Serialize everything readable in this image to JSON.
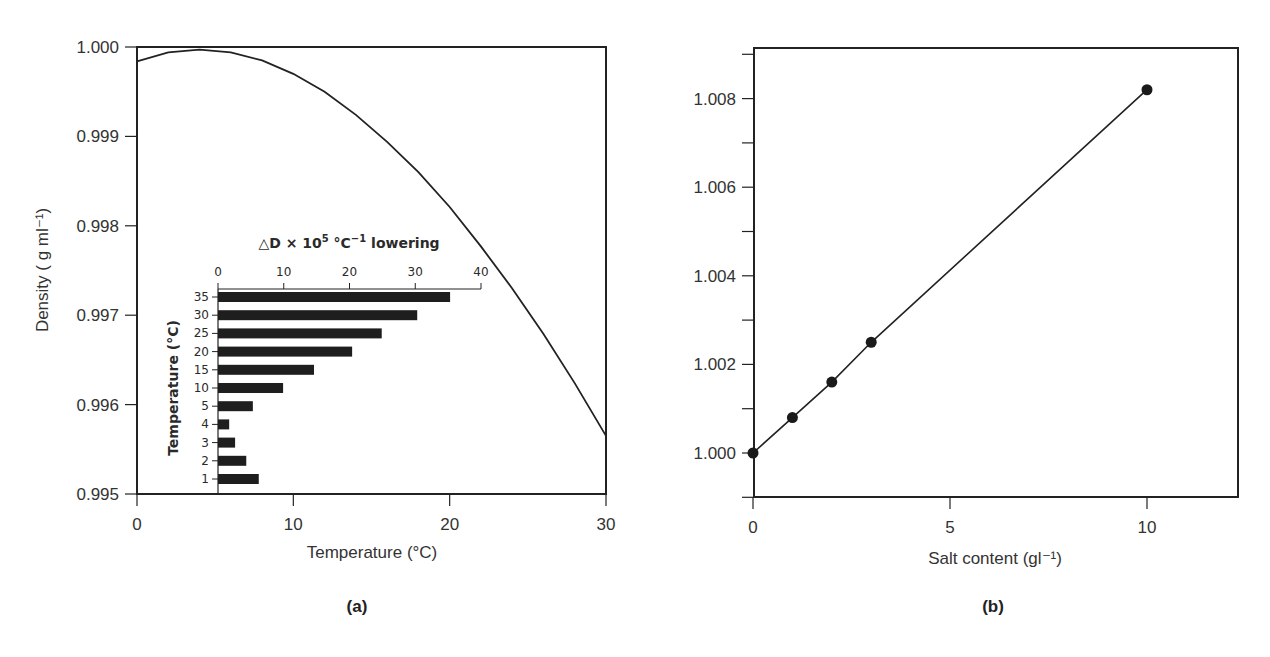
{
  "figure": {
    "panel_a_label": "(a)",
    "panel_b_label": "(b)"
  },
  "colors": {
    "ink": "#222222",
    "text": "#333333",
    "background": "#ffffff"
  },
  "chart_data": [
    {
      "id": "a",
      "type": "line",
      "title": "",
      "xlabel": "Temperature (°C)",
      "ylabel": "Density ( g ml⁻¹)",
      "xlim": [
        0,
        30
      ],
      "ylim": [
        0.995,
        1.0
      ],
      "xticks": [
        0,
        10,
        20,
        30
      ],
      "xtick_labels": [
        "0",
        "10",
        "20",
        "30"
      ],
      "yticks": [
        0.995,
        0.996,
        0.997,
        0.998,
        0.999,
        1.0
      ],
      "ytick_labels": [
        "0.995",
        "0.996",
        "0.997",
        "0.998",
        "0.999",
        "1.000"
      ],
      "grid": false,
      "series": [
        {
          "name": "Density of water",
          "x": [
            0,
            2,
            4,
            6,
            8,
            10,
            12,
            14,
            16,
            18,
            20,
            22,
            24,
            26,
            28,
            30
          ],
          "y": [
            0.99984,
            0.99994,
            0.99997,
            0.99994,
            0.99985,
            0.9997,
            0.9995,
            0.99924,
            0.99894,
            0.9986,
            0.99821,
            0.99777,
            0.9973,
            0.99679,
            0.99624,
            0.99565
          ]
        }
      ],
      "inset": {
        "type": "bar",
        "orientation": "horizontal",
        "title": "△D × 10⁵ °C⁻¹ lowering",
        "title_parts": {
          "prefix": "△D × 10",
          "exp": "5",
          "mid": " °C",
          "exp2": "−1",
          "suffix": " lowering"
        },
        "xlabel": "△D × 10⁵ °C⁻¹ lowering",
        "ylabel": "Temperature (°C)",
        "xlim": [
          0,
          40
        ],
        "xticks": [
          0,
          10,
          20,
          30,
          40
        ],
        "xtick_labels": [
          "0",
          "10",
          "20",
          "30",
          "40"
        ],
        "categories": [
          "35",
          "30",
          "25",
          "20",
          "15",
          "10",
          "5",
          "4",
          "3",
          "2",
          "1"
        ],
        "values": [
          35.3,
          30.3,
          24.9,
          20.4,
          14.6,
          9.9,
          5.3,
          1.7,
          2.6,
          4.3,
          6.2
        ]
      }
    },
    {
      "id": "b",
      "type": "line",
      "title": "",
      "xlabel": "Salt content (gl⁻¹)",
      "ylabel": "",
      "xlim": [
        0,
        12.2
      ],
      "ylim": [
        0.999,
        1.009
      ],
      "xticks": [
        0,
        5,
        10
      ],
      "xtick_labels": [
        "0",
        "5",
        "10"
      ],
      "yticks": [
        0.999,
        1.0,
        1.001,
        1.002,
        1.003,
        1.004,
        1.005,
        1.006,
        1.007,
        1.008,
        1.009
      ],
      "ytick_labels": [
        "",
        "1.000",
        "",
        "1.002",
        "",
        "1.004",
        "",
        "1.006",
        "",
        "1.008",
        ""
      ],
      "grid": false,
      "series": [
        {
          "name": "Density vs salt content",
          "x": [
            0,
            1,
            2,
            3,
            10
          ],
          "y": [
            1.0,
            1.0008,
            1.0016,
            1.0025,
            1.0082
          ],
          "markers": true
        }
      ]
    }
  ]
}
